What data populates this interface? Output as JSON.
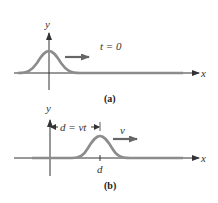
{
  "panels": [
    {
      "id": "a",
      "caption": "(a)",
      "axis_x_label": "x",
      "axis_y_label": "y",
      "time_label": "t = 0",
      "pulse_center_label": "",
      "colors": {
        "pulse": "#8c8c8c",
        "axis": "#333333",
        "arrow": "#666666"
      }
    },
    {
      "id": "b",
      "caption": "(b)",
      "axis_x_label": "x",
      "axis_y_label": "y",
      "distance_label": "d = vt",
      "velocity_label": "v",
      "tick_label": "d",
      "colors": {
        "pulse": "#8c8c8c",
        "axis": "#333333",
        "arrow": "#666666"
      }
    }
  ]
}
